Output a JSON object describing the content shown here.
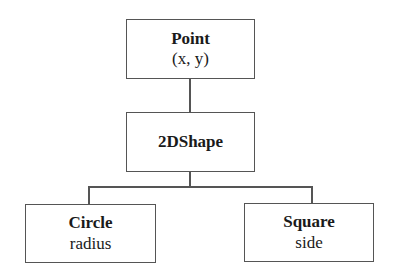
{
  "diagram": {
    "type": "class-hierarchy",
    "nodes": [
      {
        "id": "point",
        "title": "Point",
        "attribute": "(x, y)"
      },
      {
        "id": "shape2d",
        "title": "2DShape",
        "attribute": ""
      },
      {
        "id": "circle",
        "title": "Circle",
        "attribute": "radius"
      },
      {
        "id": "square",
        "title": "Square",
        "attribute": "side"
      }
    ],
    "edges": [
      {
        "from": "point",
        "to": "shape2d"
      },
      {
        "from": "shape2d",
        "to": "circle"
      },
      {
        "from": "shape2d",
        "to": "square"
      }
    ]
  }
}
